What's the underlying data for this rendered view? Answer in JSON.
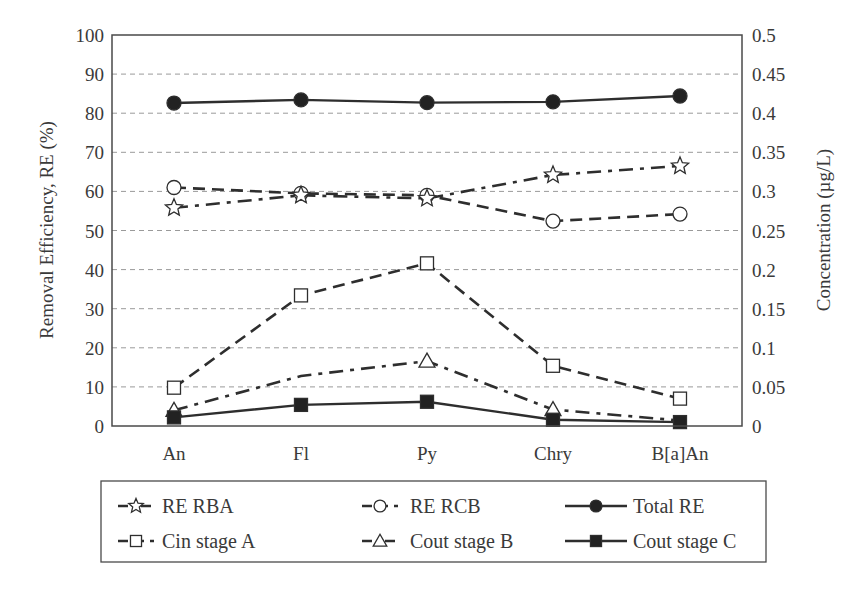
{
  "chart_data": {
    "type": "line",
    "title": "",
    "categories": [
      "An",
      "Fl",
      "Py",
      "Chry",
      "B[a]An"
    ],
    "xlabel": "",
    "ylabel": "Removal Efficiency, RE (%)",
    "ylabel_right": "Concentration (µg/L)",
    "ylim": [
      0,
      100
    ],
    "ylim_right": [
      0,
      0.5
    ],
    "yticks": [
      0,
      10,
      20,
      30,
      40,
      50,
      60,
      70,
      80,
      90,
      100
    ],
    "yticks_right": [
      "0",
      "0.05",
      "0.1",
      "0.15",
      "0.2",
      "0.25",
      "0.3",
      "0.35",
      "0.4",
      "0.45",
      "0.5"
    ],
    "grid": "horizontal dashed",
    "legend_position": "bottom",
    "series": [
      {
        "name": "RE RBA",
        "axis": "left",
        "marker": "star-open",
        "line": "dash-dot",
        "values": [
          55.8,
          59.0,
          58.2,
          64.2,
          66.5
        ],
        "show_markers": [
          true,
          true,
          true,
          true,
          true
        ]
      },
      {
        "name": "RE RCB",
        "axis": "left",
        "marker": "circle-open",
        "line": "dashed",
        "values": [
          61.0,
          59.5,
          59.0,
          52.4,
          54.2
        ],
        "show_markers": [
          true,
          true,
          true,
          true,
          true
        ]
      },
      {
        "name": "Total RE",
        "axis": "left",
        "marker": "circle-filled",
        "line": "solid",
        "values": [
          82.6,
          83.4,
          82.7,
          82.9,
          84.4
        ],
        "show_markers": [
          true,
          true,
          true,
          true,
          true
        ]
      },
      {
        "name": "Cin stage A",
        "axis": "right",
        "marker": "square-open",
        "line": "dashed",
        "values": [
          0.049,
          0.167,
          0.208,
          0.077,
          0.035
        ],
        "show_markers": [
          true,
          true,
          true,
          true,
          true
        ]
      },
      {
        "name": "Cout stage B",
        "axis": "right",
        "marker": "triangle-open",
        "line": "dash-dot",
        "values": [
          0.02,
          0.064,
          0.083,
          0.021,
          0.007
        ],
        "show_markers": [
          true,
          false,
          true,
          true,
          false
        ]
      },
      {
        "name": "Cout stage C",
        "axis": "right",
        "marker": "square-filled",
        "line": "solid",
        "values": [
          0.011,
          0.027,
          0.031,
          0.008,
          0.005
        ],
        "show_markers": [
          true,
          true,
          true,
          true,
          true
        ]
      }
    ]
  },
  "legend": {
    "items": [
      {
        "label": "RE RBA"
      },
      {
        "label": "RE RCB"
      },
      {
        "label": "Total RE"
      },
      {
        "label": "Cin stage A"
      },
      {
        "label": "Cout stage B"
      },
      {
        "label": "Cout stage C"
      }
    ]
  },
  "colors": {
    "line": "#2e2e2e",
    "grid": "#9a9a9a",
    "frame": "#4a4a4a",
    "text": "#3a3a3a"
  }
}
